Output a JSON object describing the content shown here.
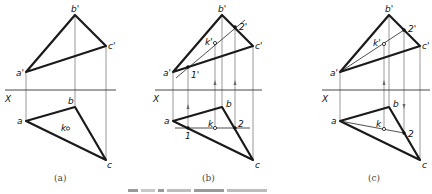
{
  "figure": {
    "panels": [
      {
        "id": "a",
        "caption": "(a)",
        "axis_label": "X",
        "labels": {
          "b_prime": "b'",
          "c_prime": "c'",
          "a_prime": "a'",
          "a": "a",
          "b": "b",
          "c": "c",
          "k": "k"
        }
      },
      {
        "id": "b",
        "caption": "(b)",
        "axis_label": "X",
        "labels": {
          "b_prime": "b'",
          "c_prime": "c'",
          "a_prime": "a'",
          "k_prime": "k'",
          "one_prime": "1'",
          "two_prime": "2'",
          "a": "a",
          "b": "b",
          "c": "c",
          "k": "k",
          "one": "1",
          "two": "2"
        }
      },
      {
        "id": "c",
        "caption": "(c)",
        "axis_label": "X",
        "labels": {
          "b_prime": "b'",
          "c_prime": "c'",
          "a_prime": "a'",
          "k_prime": "k'",
          "two_prime": "2'",
          "a": "a",
          "b": "b",
          "c": "c",
          "k": "k",
          "two": "2"
        }
      }
    ],
    "colors": {
      "object_line": "#1a1a1a",
      "projection_line": "#555555",
      "caption": "#444444"
    }
  }
}
